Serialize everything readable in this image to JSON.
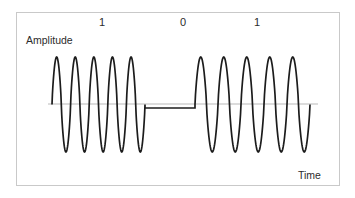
{
  "figure": {
    "background_color": "#ffffff",
    "frame_border_color": "#c9c9c9"
  },
  "axes": {
    "y_label": "Amplitude",
    "x_label": "Time",
    "baseline_color": "#b9b9b9",
    "baseline_y": 104,
    "baseline_x_start": 48,
    "baseline_x_end": 318
  },
  "bit_labels": [
    {
      "text": "1",
      "x": 103
    },
    {
      "text": "0",
      "x": 184
    },
    {
      "text": "1",
      "x": 258
    }
  ],
  "chart_data": {
    "type": "line",
    "xlabel": "Time",
    "ylabel": "Amplitude",
    "grid": false,
    "legend": null,
    "series": [
      {
        "name": "ASK modulated signal",
        "color": "#1c1c1c",
        "line_width": 1.7,
        "description": "Sinusoidal carrier bursts present for bit 1, zero amplitude for bit 0"
      }
    ],
    "bit_sequence": [
      "1",
      "0",
      "1"
    ],
    "segments": [
      {
        "bit": "1",
        "label_x": 103,
        "x_start": 52,
        "x_end": 145,
        "cycles": 5,
        "amplitude": 1.0,
        "peak_y": 57,
        "trough_y": 152,
        "carrier_on": true
      },
      {
        "bit": "0",
        "label_x": 184,
        "x_start": 145,
        "x_end": 195,
        "cycles": 0,
        "amplitude": 0.0,
        "flat_y": 108,
        "carrier_on": false
      },
      {
        "bit": "1",
        "label_x": 258,
        "x_start": 195,
        "x_end": 310,
        "cycles": 5,
        "amplitude": 1.0,
        "peak_y": 57,
        "trough_y": 152,
        "carrier_on": true
      }
    ],
    "ylim": [
      -1.15,
      1.15
    ],
    "xlim": [
      0,
      3
    ]
  }
}
